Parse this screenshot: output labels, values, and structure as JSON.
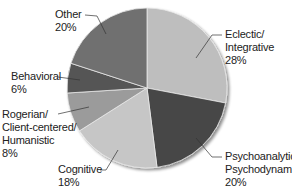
{
  "chart_data": {
    "type": "pie",
    "title": "",
    "start_angle_deg": 0,
    "direction": "clockwise",
    "slices": [
      {
        "label": "Eclectic/ Integrative",
        "lines": [
          "Eclectic/",
          "Integrative",
          "28%"
        ],
        "value": 28,
        "color": "#bebebe"
      },
      {
        "label": "Psychoanalytic/ Psychodynamic",
        "lines": [
          "Psychoanalytic/",
          "Psychodynamic",
          "20%"
        ],
        "value": 20,
        "color": "#474747"
      },
      {
        "label": "Cognitive",
        "lines": [
          "Cognitive",
          "18%"
        ],
        "value": 18,
        "color": "#c6c6c6"
      },
      {
        "label": "Rogerian/ Client-centered/ Humanistic",
        "lines": [
          "Rogerian/",
          "Client-centered/",
          "Humanistic",
          "8%"
        ],
        "value": 8,
        "color": "#9b9b9b"
      },
      {
        "label": "Behavioral",
        "lines": [
          "Behavioral",
          "6%"
        ],
        "value": 6,
        "color": "#545454"
      },
      {
        "label": "Other",
        "lines": [
          "Other",
          "20%"
        ],
        "value": 20,
        "color": "#6f6f6f"
      }
    ],
    "legend": "none (labels with leader lines)"
  },
  "labels": {
    "eclectic": {
      "line1": "Eclectic/",
      "line2": "Integrative",
      "pct": "28%"
    },
    "psychoanalytic": {
      "line1": "Psychoanalytic/",
      "line2": "Psychodynamic",
      "pct": "20%"
    },
    "cognitive": {
      "line1": "Cognitive",
      "pct": "18%"
    },
    "rogerian": {
      "line1": "Rogerian/",
      "line2": "Client-centered/",
      "line3": "Humanistic",
      "pct": "8%"
    },
    "behavioral": {
      "line1": "Behavioral",
      "pct": "6%"
    },
    "other": {
      "line1": "Other",
      "pct": "20%"
    }
  }
}
